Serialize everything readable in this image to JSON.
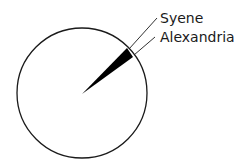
{
  "diagram": {
    "labels": {
      "syene": "Syene",
      "alexandria": "Alexandria"
    },
    "stroke_color": "#1a1a1a",
    "fill_color": "#000000"
  }
}
